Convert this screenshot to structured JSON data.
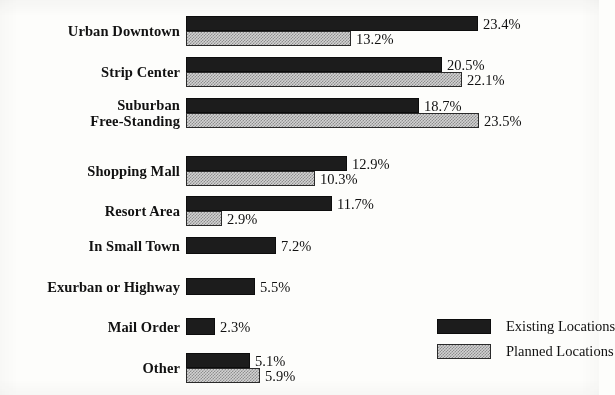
{
  "chart_data": {
    "type": "bar",
    "orientation": "horizontal",
    "title": "",
    "subtitle": "",
    "xlabel": "",
    "ylabel": "",
    "grid": false,
    "axis_visible": false,
    "tick_labels": [],
    "xlim": [
      0,
      23.5
    ],
    "value_suffix": "%",
    "legend_position": "bottom-right",
    "categories": [
      "Urban Downtown",
      "Strip Center",
      "Suburban Free-Standing",
      "Shopping Mall",
      "Resort Area",
      "In Small Town",
      "Exurban or Highway",
      "Mail Order",
      "Other"
    ],
    "series": [
      {
        "name": "Existing Locations",
        "color": "#1c1c1c",
        "pattern": "solid",
        "values": [
          23.4,
          20.5,
          18.7,
          12.9,
          11.7,
          7.2,
          5.5,
          2.3,
          5.1
        ]
      },
      {
        "name": "Planned Locations",
        "color": "#d2d2d2",
        "pattern": "stipple",
        "values": [
          13.2,
          22.1,
          23.5,
          10.3,
          2.9,
          null,
          null,
          null,
          5.9
        ]
      }
    ]
  },
  "rows": [
    {
      "label_lines": [
        "Urban Downtown"
      ],
      "existing": {
        "value": 23.4,
        "text": "23.4%"
      },
      "planned": {
        "value": 13.2,
        "text": "13.2%"
      }
    },
    {
      "label_lines": [
        "Strip Center"
      ],
      "existing": {
        "value": 20.5,
        "text": "20.5%"
      },
      "planned": {
        "value": 22.1,
        "text": "22.1%"
      }
    },
    {
      "label_lines": [
        "Suburban",
        "Free-Standing"
      ],
      "existing": {
        "value": 18.7,
        "text": "18.7%"
      },
      "planned": {
        "value": 23.5,
        "text": "23.5%"
      }
    },
    {
      "label_lines": [
        "Shopping Mall"
      ],
      "existing": {
        "value": 12.9,
        "text": "12.9%"
      },
      "planned": {
        "value": 10.3,
        "text": "10.3%"
      }
    },
    {
      "label_lines": [
        "Resort Area"
      ],
      "existing": {
        "value": 11.7,
        "text": "11.7%"
      },
      "planned": {
        "value": 2.9,
        "text": "2.9%"
      }
    },
    {
      "label_lines": [
        "In Small Town"
      ],
      "existing": {
        "value": 7.2,
        "text": "7.2%"
      },
      "planned": null
    },
    {
      "label_lines": [
        "Exurban or Highway"
      ],
      "existing": {
        "value": 5.5,
        "text": "5.5%"
      },
      "planned": null
    },
    {
      "label_lines": [
        "Mail Order"
      ],
      "existing": {
        "value": 2.3,
        "text": "2.3%"
      },
      "planned": null
    },
    {
      "label_lines": [
        "Other"
      ],
      "existing": {
        "value": 5.1,
        "text": "5.1%"
      },
      "planned": {
        "value": 5.9,
        "text": "5.9%"
      }
    }
  ],
  "legend": {
    "items": [
      {
        "label": "Existing Locations",
        "style": "existing"
      },
      {
        "label": "Planned Locations",
        "style": "planned"
      }
    ]
  },
  "layout": {
    "bar_origin_x": 186,
    "px_per_percent": 12.48,
    "row_tops": [
      16,
      57,
      98,
      156,
      196,
      237,
      278,
      318,
      353
    ],
    "paired_bar_height": 15,
    "single_bar_height": 17,
    "value_gap": 5
  }
}
